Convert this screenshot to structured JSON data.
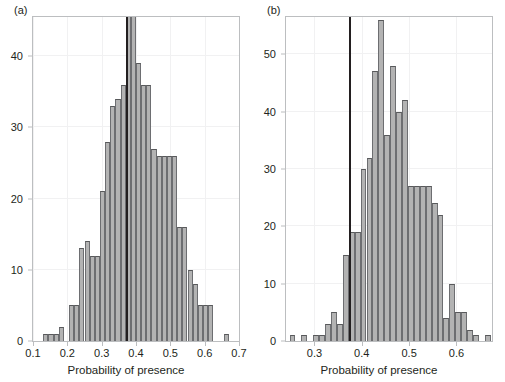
{
  "figure": {
    "background": "#ffffff",
    "bar_fill": "#b3b3b3",
    "bar_edge": "#58595b",
    "frame_color": "#bcbec0",
    "vline_color": "#231f20"
  },
  "panels": [
    {
      "id": "a",
      "label": "(a)",
      "chart_data": {
        "type": "bar",
        "title": "",
        "xlabel": "Probability of presence",
        "ylabel": "",
        "xlim": [
          0.1,
          0.7
        ],
        "ylim": [
          0,
          45.5
        ],
        "grid": true,
        "legend": null,
        "xticks": [
          "0.1",
          "0.2",
          "0.3",
          "0.4",
          "0.5",
          "0.6",
          "0.7"
        ],
        "xtick_values": [
          0.1,
          0.2,
          0.3,
          0.4,
          0.5,
          0.6,
          0.7
        ],
        "yticks": [
          "0",
          "10",
          "20",
          "30",
          "40"
        ],
        "ytick_values": [
          0,
          10,
          20,
          30,
          40
        ],
        "bin_width": 0.015,
        "annotations": [
          {
            "name": "observed-value-line",
            "type": "vline",
            "x": 0.375,
            "label": ""
          }
        ],
        "bin_starts": [
          0.13,
          0.145,
          0.16,
          0.175,
          0.19,
          0.205,
          0.22,
          0.235,
          0.25,
          0.265,
          0.28,
          0.295,
          0.31,
          0.325,
          0.34,
          0.355,
          0.37,
          0.385,
          0.4,
          0.415,
          0.43,
          0.445,
          0.46,
          0.475,
          0.49,
          0.505,
          0.52,
          0.535,
          0.55,
          0.565,
          0.58,
          0.595,
          0.61,
          0.655
        ],
        "categories": [
          "0.130",
          "0.145",
          "0.160",
          "0.175",
          "0.190",
          "0.205",
          "0.220",
          "0.235",
          "0.250",
          "0.265",
          "0.280",
          "0.295",
          "0.310",
          "0.325",
          "0.340",
          "0.355",
          "0.370",
          "0.385",
          "0.400",
          "0.415",
          "0.430",
          "0.445",
          "0.460",
          "0.475",
          "0.490",
          "0.505",
          "0.520",
          "0.535",
          "0.550",
          "0.565",
          "0.580",
          "0.595",
          "0.610",
          "0.655"
        ],
        "values": [
          1,
          1,
          1,
          2,
          0,
          5,
          5,
          13,
          14,
          12,
          12,
          21,
          28,
          33,
          34,
          36,
          46,
          46,
          39,
          36,
          36,
          27,
          26,
          26,
          26,
          26,
          16,
          16,
          10,
          8,
          5,
          5,
          5,
          1
        ]
      }
    },
    {
      "id": "b",
      "label": "(b)",
      "chart_data": {
        "type": "bar",
        "title": "",
        "xlabel": "Probability of presence",
        "ylabel": "",
        "xlim": [
          0.24,
          0.675
        ],
        "ylim": [
          0,
          56.5
        ],
        "grid": true,
        "legend": null,
        "xticks": [
          "0.3",
          "0.4",
          "0.5",
          "0.6"
        ],
        "xtick_values": [
          0.3,
          0.4,
          0.5,
          0.6
        ],
        "yticks": [
          "0",
          "10",
          "20",
          "30",
          "40",
          "50"
        ],
        "ytick_values": [
          0,
          10,
          20,
          30,
          40,
          50
        ],
        "bin_width": 0.0125,
        "annotations": [
          {
            "name": "observed-value-line",
            "type": "vline",
            "x": 0.376,
            "label": ""
          }
        ],
        "bin_starts": [
          0.2475,
          0.2725,
          0.2975,
          0.31,
          0.3225,
          0.335,
          0.3475,
          0.36,
          0.3725,
          0.385,
          0.3975,
          0.41,
          0.4225,
          0.435,
          0.4475,
          0.46,
          0.4725,
          0.485,
          0.4975,
          0.51,
          0.5225,
          0.535,
          0.5475,
          0.56,
          0.5725,
          0.585,
          0.5975,
          0.61,
          0.6225,
          0.635,
          0.66
        ],
        "categories": [
          "0.2475",
          "0.2725",
          "0.2975",
          "0.3100",
          "0.3225",
          "0.3350",
          "0.3475",
          "0.3600",
          "0.3725",
          "0.3850",
          "0.3975",
          "0.4100",
          "0.4225",
          "0.4350",
          "0.4475",
          "0.4600",
          "0.4725",
          "0.4850",
          "0.4975",
          "0.5100",
          "0.5225",
          "0.5350",
          "0.5475",
          "0.5600",
          "0.5725",
          "0.5850",
          "0.5975",
          "0.6100",
          "0.6225",
          "0.6350",
          "0.6600"
        ],
        "values": [
          1,
          1,
          1,
          1,
          3,
          5,
          3,
          15,
          19,
          19,
          30,
          32,
          47,
          56,
          36,
          48,
          40,
          42,
          27,
          27,
          27,
          27,
          24,
          22,
          4,
          10,
          5,
          5,
          2,
          1,
          1
        ]
      }
    }
  ]
}
